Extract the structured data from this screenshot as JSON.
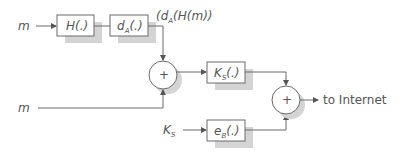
{
  "diagram": {
    "inputs": {
      "message_top": "m",
      "message_bottom": "m",
      "key_input_main": "K",
      "key_input_sub": "S"
    },
    "blocks": {
      "hash": {
        "main": "H",
        "args": "(.)"
      },
      "sign": {
        "main": "d",
        "sub": "A",
        "args": "(.)"
      },
      "symmetric_encrypt": {
        "main": "K",
        "sub": "S",
        "args": "(.)"
      },
      "public_encrypt": {
        "main": "e",
        "sub": "B",
        "args": "(.)"
      }
    },
    "signature_label": {
      "prefix": "(d",
      "sub": "A",
      "suffix": "(H(m))"
    },
    "combiners": {
      "first": "+",
      "second": "+"
    },
    "output_label": "to Internet"
  },
  "colors": {
    "stroke": "#6a6a6a",
    "text": "#555555",
    "shadow": "#d4d4d4"
  }
}
